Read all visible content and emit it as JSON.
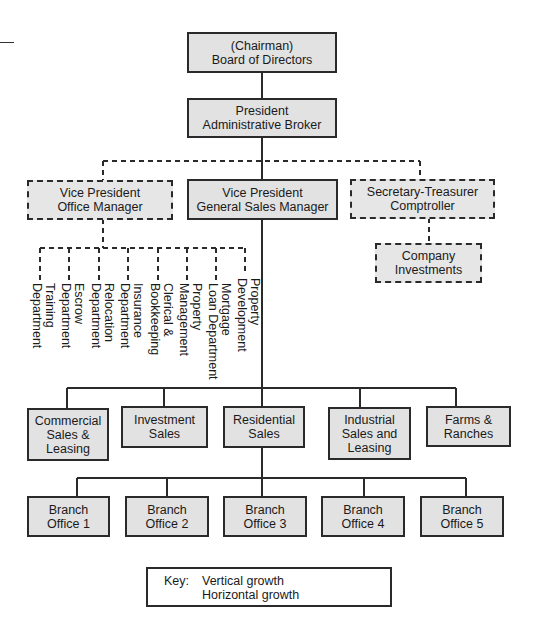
{
  "chart": {
    "type": "org-chart",
    "nodes": {
      "board": {
        "label": "(Chairman)\nBoard of Directors",
        "style": "solid"
      },
      "president": {
        "label": "President\nAdministrative Broker",
        "style": "solid"
      },
      "vp_office": {
        "label": "Vice President\nOffice Manager",
        "style": "dashed"
      },
      "vp_sales": {
        "label": "Vice President\nGeneral Sales Manager",
        "style": "solid"
      },
      "sec_treasurer": {
        "label": "Secretary-Treasurer\nComptroller",
        "style": "dashed"
      },
      "company_investments": {
        "label": "Company\nInvestments",
        "style": "dashed"
      }
    },
    "office_departments": [
      "Training\nDepartment",
      "Escrow\nDepartment",
      "Relocation\nDepartment",
      "Insurance\nDepartment",
      "Clerical &\nBookkeeping",
      "Property\nManagement",
      "Mortgage\nLoan Department",
      "Property\nDevelopment"
    ],
    "sales_divisions": [
      "Commercial\nSales &\nLeasing",
      "Investment\nSales",
      "Residential\nSales",
      "Industrial\nSales and\nLeasing",
      "Farms &\nRanches"
    ],
    "branch_offices": [
      "Branch\nOffice 1",
      "Branch\nOffice 2",
      "Branch\nOffice 3",
      "Branch\nOffice 4",
      "Branch\nOffice 5"
    ]
  },
  "key": {
    "title": "Key:",
    "vertical": "Vertical growth",
    "horizontal": "Horizontal growth"
  },
  "colors": {
    "box_fill": "#e2e2e2",
    "line": "#2a2a2a"
  }
}
